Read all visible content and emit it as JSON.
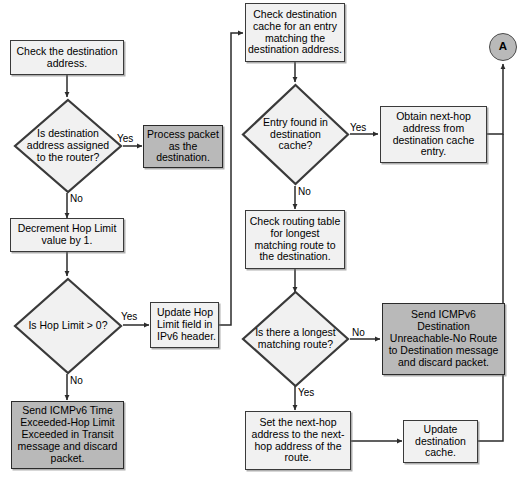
{
  "diagram": {
    "colors": {
      "shaded_fill": "#b9b9b9",
      "plain_fill": "#f1f1f1",
      "stroke": "#3a3a3a",
      "background": "#ffffff"
    },
    "nodes": [
      {
        "id": "check_dest_addr",
        "type": "process",
        "shaded": false,
        "align": "center",
        "text": "Check the destination address."
      },
      {
        "id": "is_dest_assigned",
        "type": "decision",
        "text": "Is destination address assigned to the router?"
      },
      {
        "id": "process_packet",
        "type": "process",
        "shaded": true,
        "align": "center",
        "text": "Process packet as the destination."
      },
      {
        "id": "decrement_hop",
        "type": "process",
        "shaded": false,
        "align": "center",
        "text": "Decrement Hop Limit value by 1."
      },
      {
        "id": "is_hop_gt_zero",
        "type": "decision",
        "text": "Is Hop Limit > 0?"
      },
      {
        "id": "update_hop_field",
        "type": "process",
        "shaded": false,
        "align": "left",
        "text": "Update Hop Limit field in IPv6 header."
      },
      {
        "id": "send_time_exceeded",
        "type": "process",
        "shaded": true,
        "align": "center",
        "text": "Send ICMPv6 Time Exceeded-Hop Limit Exceeded in Transit message and discard packet."
      },
      {
        "id": "check_dest_cache",
        "type": "process",
        "shaded": false,
        "align": "center",
        "text": "Check destination cache for an entry matching the destination address."
      },
      {
        "id": "entry_found",
        "type": "decision",
        "text": "Entry found in destination cache?"
      },
      {
        "id": "obtain_next_hop",
        "type": "process",
        "shaded": false,
        "align": "center",
        "text": "Obtain next-hop address from destination cache entry."
      },
      {
        "id": "check_routing",
        "type": "process",
        "shaded": false,
        "align": "center",
        "text": "Check routing table for longest matching route to the destination."
      },
      {
        "id": "is_longest_match",
        "type": "decision",
        "text": "Is there a longest matching route?"
      },
      {
        "id": "send_unreachable",
        "type": "process",
        "shaded": true,
        "align": "center",
        "text": "Send ICMPv6 Destination Unreachable-No Route to Destination message and discard packet."
      },
      {
        "id": "set_next_hop",
        "type": "process",
        "shaded": false,
        "align": "center",
        "text": "Set the next-hop address to the next-hop address of the route."
      },
      {
        "id": "update_cache",
        "type": "process",
        "shaded": false,
        "align": "center",
        "text": "Update destination cache."
      },
      {
        "id": "connector_a",
        "type": "connector",
        "text": "A"
      }
    ],
    "edge_labels": [
      {
        "id": "yes_dest_assigned",
        "text": "Yes"
      },
      {
        "id": "no_dest_assigned",
        "text": "No"
      },
      {
        "id": "yes_hop_gt_zero",
        "text": "Yes"
      },
      {
        "id": "no_hop_gt_zero",
        "text": "No"
      },
      {
        "id": "yes_entry_found",
        "text": "Yes"
      },
      {
        "id": "no_entry_found",
        "text": "No"
      },
      {
        "id": "no_longest_match",
        "text": "No"
      },
      {
        "id": "yes_longest_match",
        "text": "Yes"
      }
    ],
    "edges": [
      {
        "from": "check_dest_addr",
        "to": "is_dest_assigned",
        "label": ""
      },
      {
        "from": "is_dest_assigned",
        "to": "process_packet",
        "label": "Yes"
      },
      {
        "from": "is_dest_assigned",
        "to": "decrement_hop",
        "label": "No"
      },
      {
        "from": "decrement_hop",
        "to": "is_hop_gt_zero",
        "label": ""
      },
      {
        "from": "is_hop_gt_zero",
        "to": "update_hop_field",
        "label": "Yes"
      },
      {
        "from": "is_hop_gt_zero",
        "to": "send_time_exceeded",
        "label": "No"
      },
      {
        "from": "update_hop_field",
        "to": "check_dest_cache",
        "label": ""
      },
      {
        "from": "check_dest_cache",
        "to": "entry_found",
        "label": ""
      },
      {
        "from": "entry_found",
        "to": "obtain_next_hop",
        "label": "Yes"
      },
      {
        "from": "entry_found",
        "to": "check_routing",
        "label": "No"
      },
      {
        "from": "obtain_next_hop",
        "to": "connector_a",
        "label": ""
      },
      {
        "from": "check_routing",
        "to": "is_longest_match",
        "label": ""
      },
      {
        "from": "is_longest_match",
        "to": "send_unreachable",
        "label": "No"
      },
      {
        "from": "is_longest_match",
        "to": "set_next_hop",
        "label": "Yes"
      },
      {
        "from": "set_next_hop",
        "to": "update_cache",
        "label": ""
      },
      {
        "from": "update_cache",
        "to": "connector_a",
        "label": ""
      }
    ]
  }
}
